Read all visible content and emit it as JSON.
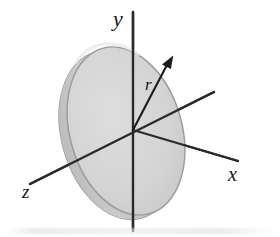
{
  "figure": {
    "kind": "3d-geometry-diagram",
    "background_color": "#ffffff",
    "axes": [
      {
        "name": "y",
        "label": "y",
        "direction": "vertical-up",
        "tip": [
          133,
          12
        ]
      },
      {
        "name": "x",
        "label": "x",
        "direction": "lower-right",
        "tip": [
          238,
          161
        ]
      },
      {
        "name": "z",
        "label": "z",
        "direction": "lower-left",
        "tip": [
          30,
          184
        ]
      }
    ],
    "labels": {
      "y": "y",
      "x": "x",
      "z": "z",
      "radius": "r"
    },
    "disk": {
      "shape": "ellipse",
      "center": [
        126,
        131
      ],
      "radius_x": 56,
      "radius_y": 86,
      "rotation_deg": -16,
      "face_fill": "#d6d6d6",
      "rim_fill": "#c2c2c2",
      "edge_stroke": "#9a9a9a",
      "thickness_px": 11
    },
    "radius_arrow": {
      "from": [
        133,
        130
      ],
      "to": [
        171,
        57
      ],
      "label": "r",
      "label_position": [
        147,
        84
      ],
      "stroke": "#1c1c20"
    },
    "colors": {
      "ink": "#16161a",
      "axis_stroke": "#2a2a2e",
      "disk_face": "#d6d6d6",
      "disk_rim": "#c2c2c2",
      "disk_outline": "#9a9a9a",
      "page": "#ffffff"
    }
  }
}
